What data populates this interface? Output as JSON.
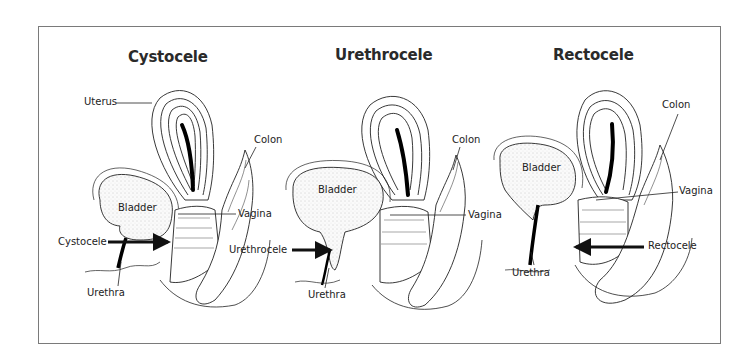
{
  "figure": {
    "panels": [
      {
        "title": "Cystocele",
        "labels": {
          "uterus": "Uterus",
          "bladder": "Bladder",
          "colon": "Colon",
          "vagina": "Vagina",
          "prolapse": "Cystocele",
          "urethra": "Urethra"
        }
      },
      {
        "title": "Urethrocele",
        "labels": {
          "bladder": "Bladder",
          "colon": "Colon",
          "vagina": "Vagina",
          "prolapse": "Urethrocele",
          "urethra": "Urethra"
        }
      },
      {
        "title": "Rectocele",
        "labels": {
          "bladder": "Bladder",
          "colon": "Colon",
          "vagina": "Vagina",
          "prolapse": "Rectocele",
          "urethra": "Urethra"
        }
      }
    ],
    "colors": {
      "line": "#222222",
      "frame": "#7a7a7a",
      "fill": "#f2f2f2"
    }
  }
}
